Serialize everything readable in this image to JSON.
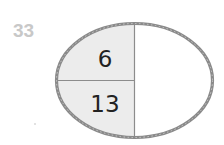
{
  "question": {
    "number": "33"
  },
  "number_bond": {
    "shape": "ellipse",
    "parts": [
      {
        "position": "top-left",
        "value": "6",
        "shaded": true
      },
      {
        "position": "bottom-left",
        "value": "13",
        "shaded": true
      },
      {
        "position": "right",
        "value": "",
        "shaded": false
      }
    ]
  },
  "colors": {
    "border": "#8a8a8a",
    "shaded_fill": "#ececec",
    "divider": "#8c8c8c",
    "question_number": "#c8c8c8",
    "digit": "#222222"
  }
}
